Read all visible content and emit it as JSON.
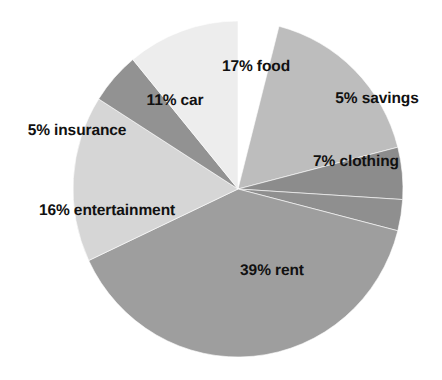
{
  "chart_data": {
    "type": "pie",
    "title": "",
    "subtitle": "",
    "xlabel": "",
    "ylabel": "",
    "legend_position": "none",
    "grid": false,
    "unit": "%",
    "total": 100,
    "background_color": "#ffffff",
    "label_color": "#111111",
    "slice_border_color": "#ffffff",
    "categories": [
      "food",
      "savings",
      "clothing",
      "rent",
      "entertainment",
      "insurance",
      "car"
    ],
    "values": [
      17,
      5,
      7,
      39,
      16,
      5,
      11
    ],
    "colors": [
      "#bdbdbd",
      "#8c8c8c",
      "#8f8f8f",
      "#9e9e9e",
      "#d6d6d6",
      "#929292",
      "#ededed"
    ],
    "slices": [
      {
        "id": "food",
        "label": "17% food",
        "percent": 17,
        "value_text": "17%",
        "name": "food",
        "color": "#bdbdbd",
        "start_angle": 0,
        "end_angle": 61.2,
        "label_x": 256,
        "label_y": 67
      },
      {
        "id": "savings",
        "label": "5% savings",
        "percent": 5,
        "value_text": "5%",
        "name": "savings",
        "color": "#8c8c8c",
        "start_angle": 61.2,
        "end_angle": 79.2,
        "label_x": 377,
        "label_y": 99
      },
      {
        "id": "clothing",
        "label": "7% clothing",
        "percent": 7,
        "value_text": "7%",
        "name": "clothing",
        "color": "#8f8f8f",
        "start_angle": 79.2,
        "end_angle": 90,
        "label_x": 356,
        "label_y": 162
      },
      {
        "id": "rent",
        "label": "39% rent",
        "percent": 39,
        "value_text": "39%",
        "name": "rent",
        "color": "#9e9e9e",
        "start_angle": 90,
        "end_angle": 230.4,
        "label_x": 272,
        "label_y": 271
      },
      {
        "id": "entertainment",
        "label": "16% entertainment",
        "percent": 16,
        "value_text": "16%",
        "name": "entertainment",
        "color": "#d6d6d6",
        "start_angle": 230.4,
        "end_angle": 288,
        "label_x": 107,
        "label_y": 211
      },
      {
        "id": "insurance",
        "label": "5% insurance",
        "percent": 5,
        "value_text": "5%",
        "name": "insurance",
        "color": "#929292",
        "start_angle": 288,
        "end_angle": 306,
        "label_x": 77,
        "label_y": 131
      },
      {
        "id": "car",
        "label": "11% car",
        "percent": 11,
        "value_text": "11%",
        "name": "car",
        "color": "#ededed",
        "start_angle": 306,
        "end_angle": 345.6,
        "label_x": 175,
        "label_y": 101
      }
    ],
    "geometry": {
      "center_x": 238,
      "center_y": 189,
      "radius_x": 165,
      "radius_y": 168,
      "rotation_offset_deg": 14.4
    }
  }
}
